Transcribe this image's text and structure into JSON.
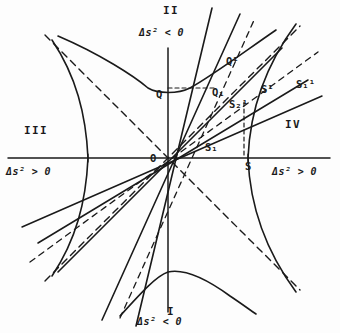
{
  "figure": {
    "type": "minkowski-spacetime-diagram",
    "quadrant_labels": {
      "top": "II",
      "bottom": "I",
      "left": "III",
      "right": "IV"
    },
    "interval_labels": {
      "top": "Δs² < 0",
      "bottom": "Δs² < 0",
      "left": "Δs² > 0",
      "right": "Δs² > 0"
    },
    "points": {
      "origin": "O",
      "q": "Q",
      "q1": "Q₁",
      "q_prime": "Q¹",
      "s": "S",
      "s1": "S₁",
      "s_prime": "S¹",
      "s1_prime": "S₁¹",
      "s2_prime": "S₂¹"
    },
    "colors": {
      "ink": "#1a1a1a",
      "paper": "#fdfdfd"
    },
    "geometry": {
      "origin_px": [
        168,
        158
      ],
      "hyperbola_a_px": 80,
      "asymptote_slope": 1
    }
  }
}
